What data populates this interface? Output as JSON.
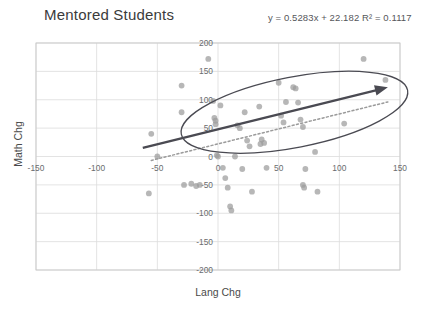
{
  "chart_data": {
    "type": "scatter",
    "title": "Mentored Students",
    "xlabel": "Lang Chg",
    "ylabel": "Math Chg",
    "xlim": [
      -150,
      150
    ],
    "ylim": [
      -200,
      200
    ],
    "xticks": [
      -150,
      -100,
      -50,
      0,
      50,
      100,
      150
    ],
    "yticks": [
      200,
      150,
      100,
      50,
      0,
      -50,
      -100,
      -150,
      -200
    ],
    "grid": true,
    "legend": "none",
    "point_color": "#9b9b9b",
    "trendline_color": "#9b9b9b",
    "annotation_color": "#4a4a52",
    "annotations": {
      "equation": "y = 0.5283x + 22.182   R² = 0.1117",
      "equation_text": "y = 0.5283x + 22.182",
      "r_squared_text": "R² = 0.1117",
      "slope": 0.5283,
      "intercept": 22.182,
      "r_squared": 0.1117,
      "ellipse": {
        "label": "highlight-ellipse",
        "cx": 63,
        "cy": 78,
        "rx": 95,
        "ry": 62,
        "rotation": -11
      },
      "arrow": {
        "label": "trend-direction-arrow",
        "x1": -62,
        "y1": 15,
        "x2": 140,
        "y2": 122
      }
    },
    "points": [
      {
        "x": -57,
        "y": -65
      },
      {
        "x": -55,
        "y": 40
      },
      {
        "x": -50,
        "y": 0
      },
      {
        "x": -30,
        "y": 125
      },
      {
        "x": -30,
        "y": 78
      },
      {
        "x": -28,
        "y": -50
      },
      {
        "x": -22,
        "y": -48
      },
      {
        "x": -18,
        "y": -52
      },
      {
        "x": -15,
        "y": -50
      },
      {
        "x": -8,
        "y": 172
      },
      {
        "x": -4,
        "y": 98
      },
      {
        "x": -3,
        "y": 68
      },
      {
        "x": -2,
        "y": 63
      },
      {
        "x": -2,
        "y": 57
      },
      {
        "x": -1,
        "y": 2
      },
      {
        "x": 0,
        "y": 0
      },
      {
        "x": 2,
        "y": 90
      },
      {
        "x": 4,
        "y": -20
      },
      {
        "x": 6,
        "y": -38
      },
      {
        "x": 8,
        "y": -55
      },
      {
        "x": 10,
        "y": -88
      },
      {
        "x": 11,
        "y": -95
      },
      {
        "x": 14,
        "y": 0
      },
      {
        "x": 16,
        "y": 55
      },
      {
        "x": 18,
        "y": 50
      },
      {
        "x": 20,
        "y": -22
      },
      {
        "x": 22,
        "y": 78
      },
      {
        "x": 24,
        "y": 28
      },
      {
        "x": 26,
        "y": 18
      },
      {
        "x": 28,
        "y": -62
      },
      {
        "x": 34,
        "y": 88
      },
      {
        "x": 35,
        "y": 22
      },
      {
        "x": 36,
        "y": 30
      },
      {
        "x": 38,
        "y": 24
      },
      {
        "x": 40,
        "y": -20
      },
      {
        "x": 50,
        "y": 130
      },
      {
        "x": 52,
        "y": 72
      },
      {
        "x": 54,
        "y": 60
      },
      {
        "x": 56,
        "y": 96
      },
      {
        "x": 62,
        "y": 122
      },
      {
        "x": 64,
        "y": 120
      },
      {
        "x": 66,
        "y": 95
      },
      {
        "x": 68,
        "y": 65
      },
      {
        "x": 70,
        "y": 52
      },
      {
        "x": 70,
        "y": -50
      },
      {
        "x": 71,
        "y": -55
      },
      {
        "x": 72,
        "y": -22
      },
      {
        "x": 80,
        "y": 8
      },
      {
        "x": 82,
        "y": -62
      },
      {
        "x": 104,
        "y": 58
      },
      {
        "x": 120,
        "y": 172
      },
      {
        "x": 138,
        "y": 135
      }
    ]
  }
}
